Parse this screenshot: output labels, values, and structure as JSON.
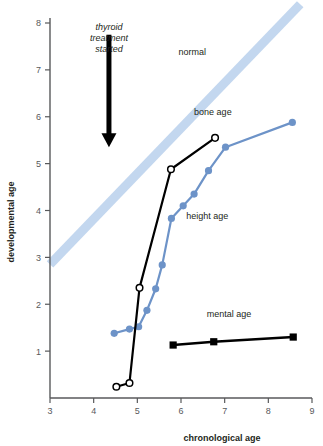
{
  "chart_data": {
    "type": "line",
    "title": "",
    "xlabel": "chronological age",
    "ylabel": "developmental age",
    "xlim": [
      3,
      9
    ],
    "ylim": [
      0,
      8.4
    ],
    "xticks": [
      3,
      4,
      5,
      6,
      7,
      8,
      9
    ],
    "yticks": [
      1,
      2,
      3,
      4,
      5,
      6,
      7,
      8
    ],
    "grid": false,
    "legend_position": "inline-annotations",
    "series": [
      {
        "name": "normal",
        "label": "normal",
        "style": "band",
        "color": "#c3d7ef",
        "x": [
          3.0,
          8.73
        ],
        "y": [
          2.85,
          8.4
        ],
        "label_x": 6.26,
        "label_y": 7.32
      },
      {
        "name": "bone age",
        "label": "bone age",
        "style": "line-open-circles",
        "color": "#000000",
        "marker_fill": "#ffffff",
        "x": [
          4.52,
          4.82,
          5.05,
          5.77,
          6.78
        ],
        "y": [
          0.24,
          0.32,
          2.35,
          4.88,
          5.55
        ],
        "label_x": 6.73,
        "label_y": 6.04
      },
      {
        "name": "height age",
        "label": "height age",
        "style": "line-filled-circles",
        "color": "#6d93c8",
        "x": [
          4.47,
          4.82,
          5.03,
          5.22,
          5.42,
          5.57,
          5.78,
          6.05,
          6.3,
          6.63,
          7.02,
          8.55
        ],
        "y": [
          1.38,
          1.47,
          1.52,
          1.87,
          2.33,
          2.84,
          3.83,
          4.1,
          4.35,
          4.85,
          5.35,
          5.88
        ],
        "label_x": 6.6,
        "label_y": 3.82
      },
      {
        "name": "mental age",
        "label": "mental age",
        "style": "line-filled-squares",
        "color": "#000000",
        "x": [
          5.82,
          6.75,
          8.57
        ],
        "y": [
          1.13,
          1.2,
          1.3
        ],
        "label_x": 7.1,
        "label_y": 1.72
      }
    ],
    "annotations": [
      {
        "name": "thyroid-treatment-started",
        "text_lines": [
          "thyroid",
          "treatment",
          "started"
        ],
        "arrow": {
          "x": 4.35,
          "y_from": 7.75,
          "y_to": 5.35
        }
      }
    ]
  },
  "axes": {
    "x_label": "chronological age",
    "y_label": "developmental age",
    "x_tick_labels": [
      "3",
      "4",
      "5",
      "6",
      "7",
      "8",
      "9"
    ],
    "y_tick_labels": [
      "1",
      "2",
      "3",
      "4",
      "5",
      "6",
      "7",
      "8"
    ]
  },
  "colors": {
    "axis": "#58595b",
    "band": "#c3d7ef",
    "height_age": "#6d93c8",
    "black": "#000000",
    "text": "#231f20"
  },
  "caption_fragment": ""
}
